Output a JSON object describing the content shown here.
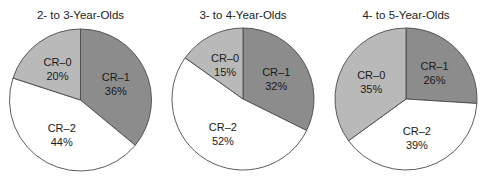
{
  "chart_data": [
    {
      "type": "pie",
      "title": "2- to 3-Year-Olds",
      "categories": [
        "CR–1",
        "CR–2",
        "CR–0"
      ],
      "values": [
        36,
        44,
        20
      ],
      "labels": [
        "36%",
        "44%",
        "20%"
      ],
      "start_angle": "12 o'clock",
      "direction": "clockwise"
    },
    {
      "type": "pie",
      "title": "3- to 4-Year-Olds",
      "categories": [
        "CR–1",
        "CR–2",
        "CR–0"
      ],
      "values": [
        32,
        52,
        15
      ],
      "labels": [
        "32%",
        "52%",
        "15%"
      ],
      "start_angle": "12 o'clock",
      "direction": "clockwise"
    },
    {
      "type": "pie",
      "title": "4- to 5-Year-Olds",
      "categories": [
        "CR–1",
        "CR–2",
        "CR–0"
      ],
      "values": [
        26,
        39,
        35
      ],
      "labels": [
        "26%",
        "39%",
        "35%"
      ],
      "start_angle": "12 o'clock",
      "direction": "clockwise"
    }
  ],
  "colors": {
    "CR–1": "#8c8c8c",
    "CR–2": "#ffffff",
    "CR–0": "#b9b9b9",
    "stroke": "#4a4a4a"
  },
  "layout": [
    {
      "cx": 80.5,
      "cy": 100,
      "r": 71,
      "title_y": 19
    },
    {
      "cx": 243,
      "cy": 99,
      "r": 71,
      "title_y": 19
    },
    {
      "cx": 406,
      "cy": 99,
      "r": 71,
      "title_y": 19
    }
  ]
}
